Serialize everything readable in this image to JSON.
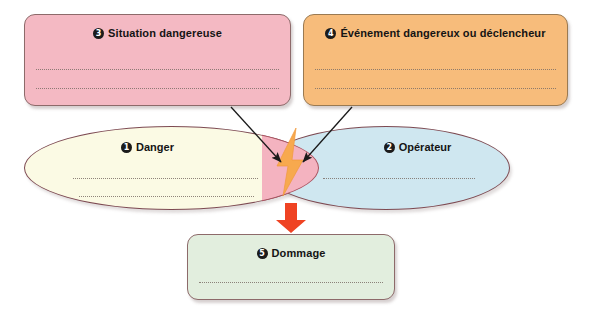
{
  "diagram": {
    "boxes": [
      {
        "id": "situation",
        "number": "3",
        "label": "Situation dangereuse",
        "color": "#f4b9c3",
        "writing_lines": 2
      },
      {
        "id": "evenement",
        "number": "4",
        "label": "Événement dangereux ou déclencheur",
        "color": "#f7bc7b",
        "writing_lines": 2
      },
      {
        "id": "dommage",
        "number": "5",
        "label": "Dommage",
        "color": "#e2eede",
        "writing_lines": 1
      }
    ],
    "ellipses": [
      {
        "id": "danger",
        "number": "1",
        "label": "Danger",
        "color": "#fbfae4",
        "writing_lines": 2
      },
      {
        "id": "operateur",
        "number": "2",
        "label": "Opérateur",
        "color": "#cfe7f0",
        "writing_lines": 1
      }
    ],
    "intersection": {
      "id": "intersection",
      "color": "#f4b3c0",
      "icon": "lightning-bolt-icon",
      "icon_color": "#f7a94e"
    },
    "arrows": [
      {
        "id": "arrow-situation-to-intersection",
        "color": "#1a1a1a",
        "style": "thin-line"
      },
      {
        "id": "arrow-evenement-to-intersection",
        "color": "#1a1a1a",
        "style": "thin-line"
      },
      {
        "id": "arrow-intersection-to-dommage",
        "color": "#ef4323",
        "style": "thick-block"
      }
    ],
    "colors": {
      "situation": "#f4b9c3",
      "evenement": "#f7bc7b",
      "dommage": "#e2eede",
      "danger": "#fbfae4",
      "operateur": "#cfe7f0",
      "intersection": "#f4b3c0",
      "bolt": "#f7a94e",
      "down_arrow": "#ef4323",
      "outline": "#8d6a6a"
    }
  }
}
